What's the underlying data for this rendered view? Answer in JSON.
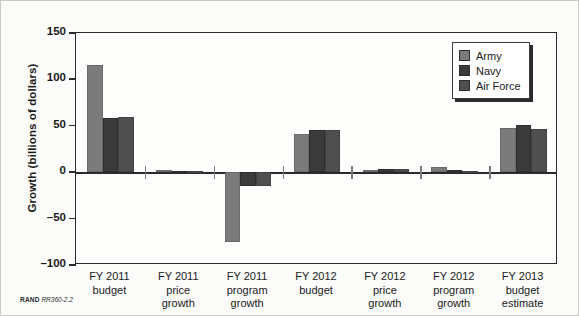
{
  "figure": {
    "footer_org": "RAND",
    "footer_code": "RR360-2.2"
  },
  "legend": {
    "position": "top-right",
    "entries": [
      {
        "label": "Army",
        "color": "#7b7b7b",
        "icon": "legend-swatch-army"
      },
      {
        "label": "Navy",
        "color": "#3a3a3a",
        "icon": "legend-swatch-navy"
      },
      {
        "label": "Air Force",
        "color": "#4f4f4f",
        "icon": "legend-swatch-air-force"
      }
    ]
  },
  "chart_data": {
    "type": "bar",
    "title": "",
    "xlabel": "",
    "ylabel": "Growth (billions of dollars)",
    "ylim": [
      -100,
      150
    ],
    "yticks": [
      150,
      100,
      50,
      0,
      -50,
      -100
    ],
    "ytick_labels": [
      "150",
      "100",
      "50",
      "0",
      "–50",
      "–100"
    ],
    "grid": false,
    "legend_position": "upper right",
    "categories": [
      "FY 2011 budget",
      "FY 2011 price growth",
      "FY 2011 program growth",
      "FY 2012 budget",
      "FY 2012 price growth",
      "FY 2012 program growth",
      "FY 2013 budget estimate"
    ],
    "category_lines": [
      [
        "FY 2011",
        "budget"
      ],
      [
        "FY 2011",
        "price",
        "growth"
      ],
      [
        "FY 2011",
        "program",
        "growth"
      ],
      [
        "FY 2012",
        "budget"
      ],
      [
        "FY 2012",
        "price",
        "growth"
      ],
      [
        "FY 2012",
        "program",
        "growth"
      ],
      [
        "FY 2013",
        "budget",
        "estimate"
      ]
    ],
    "series": [
      {
        "name": "Army",
        "color": "#7b7b7b",
        "values": [
          115,
          2,
          -75,
          41,
          2,
          6,
          48
        ]
      },
      {
        "name": "Navy",
        "color": "#3a3a3a",
        "values": [
          58,
          1,
          -15,
          46,
          3,
          2,
          51
        ]
      },
      {
        "name": "Air Force",
        "color": "#4f4f4f",
        "values": [
          59,
          1,
          -15,
          46,
          3,
          1,
          47
        ]
      }
    ]
  }
}
